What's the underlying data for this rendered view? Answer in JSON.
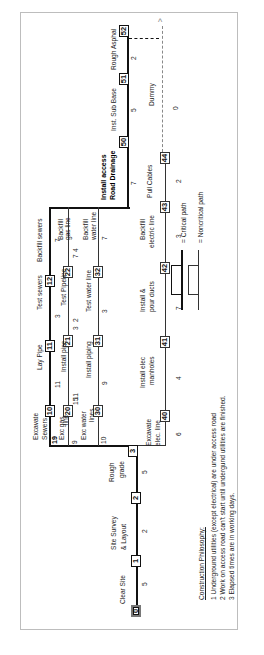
{
  "diagram": {
    "type": "activity-on-arrow network (rotated 90° CCW)",
    "nodes": [
      "0",
      "1",
      "2",
      "3",
      "10",
      "11",
      "12",
      "20",
      "21",
      "22",
      "30",
      "31",
      "32",
      "40",
      "41",
      "42",
      "43",
      "44",
      "50",
      "51",
      "52"
    ],
    "activities": {
      "clear_site": "Clear Site",
      "site_survey_1": "Site Survey",
      "site_survey_2": "& Layout",
      "rough_grade_1": "Rough",
      "rough_grade_2": "grade",
      "excavate_sewers_1": "Excavate",
      "excavate_sewers_2": "Sewers",
      "lay_pipe": "Lay Pipe",
      "test_sewers": "Test sewers",
      "backfill_sewers": "Backfill sewers",
      "exc_gas_1": "Exc  gas",
      "exc_gas_2": "line",
      "install_pipe": "Install pipe",
      "test_pipeline": "Test Pipeline",
      "backfill_gas_1": "Backfill",
      "backfill_gas_2": "gas line",
      "exc_water_1": "Exc  water",
      "exc_water_2": "lines",
      "install_piping": "Install piping",
      "test_water": "Test water line",
      "backfill_water_1": "Backfill",
      "backfill_water_2": "water line",
      "excavate_elec_1": "Excavate",
      "excavate_elec_2": "elec. line",
      "install_manholes_1": "Install elec",
      "install_manholes_2": "manholes",
      "install_ducts_1": "Install &",
      "install_ducts_2": "pour ducts",
      "backfill_elec_1": "Backfill",
      "backfill_elec_2": "electric line",
      "pull_cables": "Pull Cables",
      "install_access_1": "Install access",
      "install_access_2": "Road Drainage",
      "inst_sub_base": "Inst. Sub Base",
      "rough_asphalt": "Rough Asphal",
      "dummy": "Dummy"
    },
    "durations": {
      "d_0_1": "5",
      "d_1_2": "2",
      "d_2_3": "5",
      "d_10_11": "11",
      "d_11_12": "3",
      "d_12_end": "7",
      "d_sewer_gas": "19",
      "d_20_21": "11",
      "d_21_22": "3",
      "d_22_end": "7",
      "d_gas_water": "9",
      "d_30_31": "15",
      "d_31_32": "2",
      "d_32_end": "4",
      "d_water_row": "10",
      "d_w_9": "9",
      "d_w_3": "3",
      "d_w_7": "7",
      "d_3_40": "6",
      "d_40_41": "4",
      "d_41_42": "7",
      "d_42_43": "3",
      "d_43_44": "2",
      "d_to_50": "7",
      "d_50_51": "5",
      "d_51_52": "2",
      "d_dummy": "0"
    }
  },
  "legend": {
    "critical": "= Critical path",
    "noncritical": "= Noncritical path"
  },
  "notes": {
    "title": "Construction Philosophy:",
    "items": [
      "1  Underground utilities (except electrical) are under access road",
      "2  Work on access road can't start until undergund utilities are finished.",
      "3  Elapsed times are in working days."
    ]
  }
}
